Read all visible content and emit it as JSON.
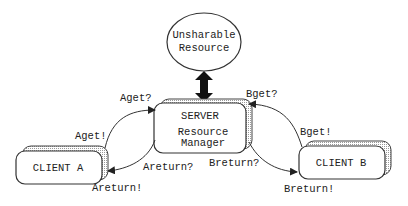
{
  "diagram": {
    "resource": {
      "line1": "Unsharable",
      "line2": "Resource"
    },
    "server": {
      "title": "SERVER",
      "line1": "Resource",
      "line2": "Manager"
    },
    "client_a": {
      "label": "CLIENT A"
    },
    "client_b": {
      "label": "CLIENT B"
    },
    "messages": {
      "aget_q": "Aget?",
      "aget_x": "Aget!",
      "areturn_q": "Areturn?",
      "areturn_x": "Areturn!",
      "bget_q": "Bget?",
      "bget_x": "Bget!",
      "breturn_q": "Breturn?",
      "breturn_x": "Breturn!"
    },
    "colors": {
      "stroke": "#333333",
      "shadow_fill": "#d8d8d8",
      "arrow_fill": "#111111",
      "background": "#ffffff"
    }
  }
}
